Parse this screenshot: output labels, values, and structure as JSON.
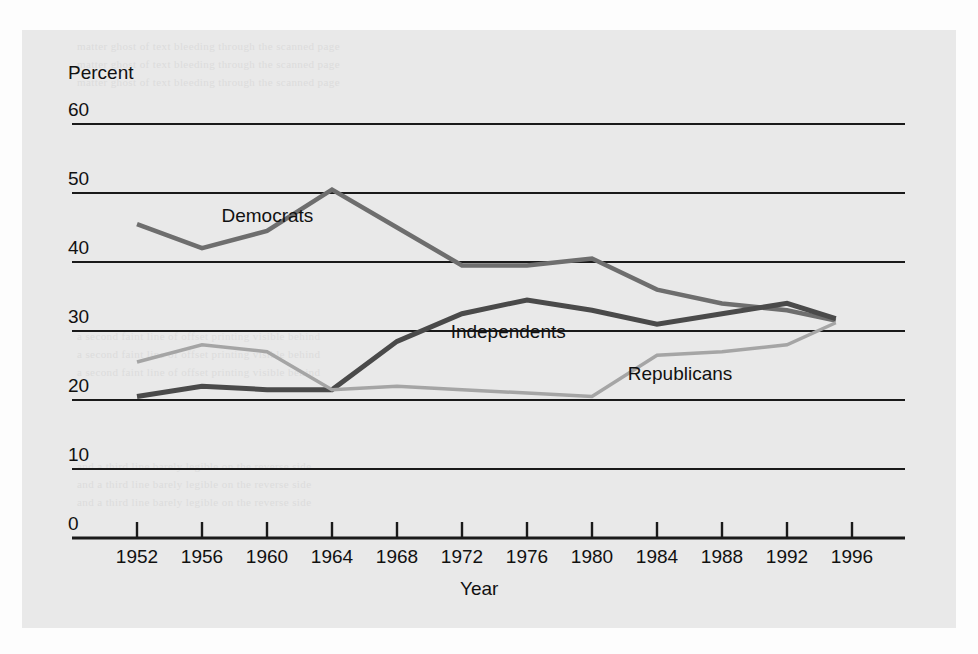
{
  "chart_data": {
    "type": "line",
    "title": "",
    "xlabel": "Year",
    "ylabel": "Percent",
    "ylim": [
      0,
      60
    ],
    "ytick_values": [
      0,
      10,
      20,
      30,
      40,
      50,
      60
    ],
    "ytick_labels": [
      "0",
      "10",
      "20",
      "30",
      "40",
      "50",
      "60"
    ],
    "xlim": [
      1950,
      1998
    ],
    "x": [
      1952,
      1956,
      1960,
      1964,
      1968,
      1972,
      1976,
      1980,
      1984,
      1988,
      1992,
      1995
    ],
    "categories": [
      "1952",
      "1956",
      "1960",
      "1964",
      "1968",
      "1972",
      "1976",
      "1980",
      "1984",
      "1988",
      "1992",
      "1996"
    ],
    "xtick_labels": [
      "1952",
      "1956",
      "1960",
      "1964",
      "1968",
      "1972",
      "1976",
      "1980",
      "1984",
      "1988",
      "1992",
      "1996"
    ],
    "grid": "horizontal",
    "legend": "inline-labels",
    "series": [
      {
        "name": "Democrats",
        "color": "#6e6e6e",
        "width": 4.5,
        "label_x": 1957.2,
        "label_y": 46.5,
        "values": [
          45.5,
          42.0,
          44.5,
          50.5,
          45.0,
          39.5,
          39.5,
          40.5,
          36.0,
          34.0,
          33.0,
          31.5
        ]
      },
      {
        "name": "Independents",
        "color": "#4a4a4a",
        "width": 5.0,
        "label_x": 1971.3,
        "label_y": 29.7,
        "values": [
          20.5,
          22.0,
          21.5,
          21.5,
          28.5,
          32.5,
          34.5,
          33.0,
          31.0,
          32.5,
          34.0,
          31.8
        ]
      },
      {
        "name": "Republicans",
        "color": "#a5a5a5",
        "width": 3.5,
        "label_x": 1982.2,
        "label_y": 23.6,
        "values": [
          25.5,
          28.0,
          27.0,
          21.5,
          22.0,
          21.5,
          21.0,
          20.5,
          26.5,
          27.0,
          28.0,
          31.2
        ]
      }
    ]
  },
  "scan": {
    "ghost_lines": [
      "matter ghost of text bleeding through the scanned page",
      "a second faint line of offset printing visible behind",
      "and a third line barely legible on the reverse side"
    ]
  }
}
